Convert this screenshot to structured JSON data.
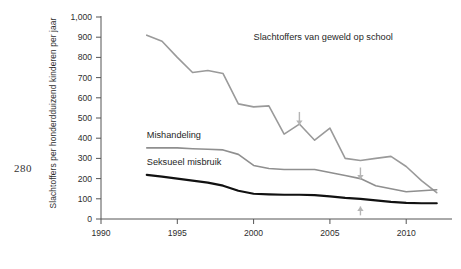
{
  "page": {
    "number": "280"
  },
  "chart_data": {
    "type": "line",
    "title": "",
    "xlabel": "",
    "ylabel": "Slachtoffers per honderdduizend kinderen per jaar",
    "xlim": [
      1990,
      2013
    ],
    "ylim": [
      0,
      1000
    ],
    "grid": false,
    "legend_position": "inline-labels",
    "xticks": [
      "1990",
      "1995",
      "2000",
      "2005",
      "2010"
    ],
    "xtick_values": [
      1990,
      1995,
      2000,
      2005,
      2010
    ],
    "yticks": [
      "0",
      "100",
      "200",
      "300",
      "400",
      "500",
      "600",
      "700",
      "800",
      "900",
      "1,000"
    ],
    "ytick_values": [
      0,
      100,
      200,
      300,
      400,
      500,
      600,
      700,
      800,
      900,
      1000
    ],
    "x": [
      1993,
      1994,
      1995,
      1996,
      1997,
      1998,
      1999,
      2000,
      2001,
      2002,
      2003,
      2004,
      2005,
      2006,
      2007,
      2008,
      2009,
      2010,
      2011,
      2012
    ],
    "series": [
      {
        "name": "Slachtoffers van geweld op school",
        "color": "#9a9a9a",
        "width": 1.6,
        "label_x": 2000,
        "label_y": 885,
        "values": [
          910,
          880,
          800,
          725,
          735,
          720,
          570,
          555,
          560,
          420,
          470,
          390,
          450,
          300,
          290,
          300,
          310,
          260,
          190,
          130
        ]
      },
      {
        "name": "Mishandeling",
        "color": "#8f8f8f",
        "width": 1.6,
        "label_x": 1993,
        "label_y": 400,
        "values": [
          352,
          352,
          352,
          348,
          345,
          342,
          320,
          265,
          250,
          245,
          245,
          245,
          230,
          215,
          200,
          165,
          150,
          135,
          140,
          145
        ]
      },
      {
        "name": "Seksueel misbruik",
        "color": "#111111",
        "width": 2.2,
        "label_x": 1993,
        "label_y": 268,
        "values": [
          218,
          210,
          200,
          190,
          180,
          165,
          140,
          125,
          122,
          120,
          120,
          118,
          112,
          105,
          100,
          92,
          85,
          80,
          78,
          78
        ]
      }
    ],
    "annotations": [
      {
        "name": "arrow-2003-down",
        "x": 2003,
        "y_from": 530,
        "y_to": 465,
        "direction": "down",
        "color": "#b5b5b5"
      },
      {
        "name": "arrow-2007-down",
        "x": 2007,
        "y_from": 255,
        "y_to": 195,
        "direction": "down",
        "color": "#b5b5b5"
      },
      {
        "name": "arrow-2007-up",
        "x": 2007,
        "y_from": 18,
        "y_to": 62,
        "direction": "up",
        "color": "#b5b5b5"
      }
    ]
  }
}
